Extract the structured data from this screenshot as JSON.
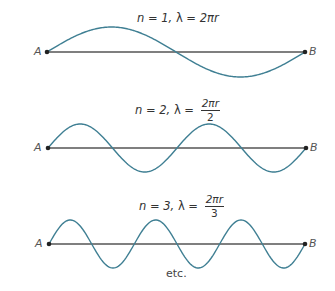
{
  "colors": {
    "wave": "#3f7f93",
    "baseline": "#555555",
    "point": "#222222",
    "text": "#333333"
  },
  "diagrams": [
    {
      "n_label": "n = 1, ",
      "lambda_label": "λ = ",
      "lambda_value": "2πr",
      "lambda_fraction": null,
      "point_a": "A",
      "point_b": "B",
      "modes": 1
    },
    {
      "n_label": "n = 2, ",
      "lambda_label": "λ = ",
      "lambda_numerator": "2πr",
      "lambda_denominator": "2",
      "point_a": "A",
      "point_b": "B",
      "modes": 2
    },
    {
      "n_label": "n = 3, ",
      "lambda_label": "λ = ",
      "lambda_numerator": "2πr",
      "lambda_denominator": "3",
      "point_a": "A",
      "point_b": "B",
      "modes": 3
    }
  ],
  "footer": "etc."
}
